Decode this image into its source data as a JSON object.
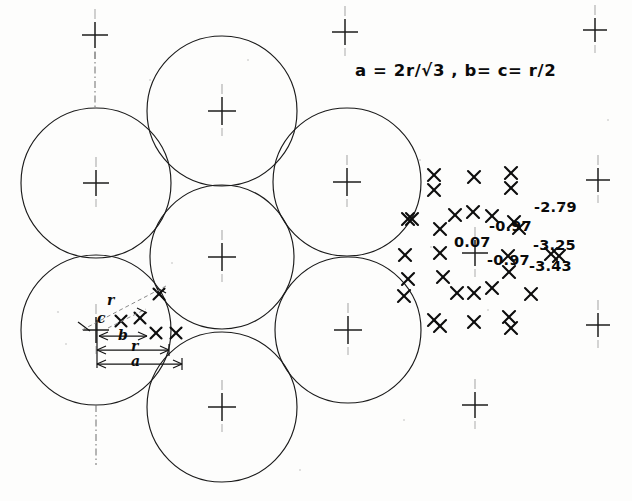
{
  "figure": {
    "kind": "engineering-drawing",
    "background_color": "#fdfdfc",
    "ink_color": "#0d0d0d"
  },
  "formula": {
    "text": "a =  2r/√3  ,   b=  c=  r/2",
    "parts": {
      "a_expression": "a = 2r/√3",
      "separator": ",",
      "bc_expression": "b= c= r/2"
    },
    "x": 355,
    "y": 76
  },
  "dimension_labels": [
    {
      "name": "r-radius-upper",
      "text": "r",
      "x": 107,
      "y": 305
    },
    {
      "name": "c-dimension",
      "text": "c",
      "x": 97,
      "y": 323
    },
    {
      "name": "b-dimension",
      "text": "b",
      "x": 118,
      "y": 340
    },
    {
      "name": "r-dimension-lower",
      "text": "r",
      "x": 131,
      "y": 351
    },
    {
      "name": "a-dimension",
      "text": "a",
      "x": 131,
      "y": 366
    }
  ],
  "measurements": [
    {
      "name": "value-center",
      "text": "0.07",
      "x": 454,
      "y": 247
    },
    {
      "name": "value-upper-mid",
      "text": "-0.97",
      "x": 489,
      "y": 231
    },
    {
      "name": "value-lower-mid",
      "text": "-0.97",
      "x": 487,
      "y": 265
    },
    {
      "name": "value-top-right",
      "text": "-2.79",
      "x": 534,
      "y": 212
    },
    {
      "name": "value-mid-right",
      "text": "-3.25",
      "x": 533,
      "y": 250
    },
    {
      "name": "value-bottom-right",
      "text": "-3.43",
      "x": 529,
      "y": 271
    }
  ],
  "circles": [
    {
      "name": "circle-top-center",
      "cx": 222,
      "cy": 111,
      "r": 75
    },
    {
      "name": "circle-upper-left",
      "cx": 96,
      "cy": 183,
      "r": 75
    },
    {
      "name": "circle-upper-right",
      "cx": 347,
      "cy": 182,
      "r": 74
    },
    {
      "name": "circle-center",
      "cx": 222,
      "cy": 257,
      "r": 72
    },
    {
      "name": "circle-lower-left",
      "cx": 96,
      "cy": 330,
      "r": 75
    },
    {
      "name": "circle-lower-right",
      "cx": 348,
      "cy": 330,
      "r": 73
    },
    {
      "name": "circle-bottom-center",
      "cx": 222,
      "cy": 407,
      "r": 75
    }
  ],
  "crosshairs": [
    {
      "name": "crosshair-top-left-stray",
      "cx": 95,
      "cy": 35,
      "size": 13,
      "faint": false
    },
    {
      "name": "crosshair-top-right-stray",
      "cx": 345,
      "cy": 32,
      "size": 13,
      "faint": false
    },
    {
      "name": "crosshair-far-top-right",
      "cx": 595,
      "cy": 30,
      "size": 12,
      "faint": false
    },
    {
      "name": "crosshair-top-center",
      "cx": 222,
      "cy": 111,
      "size": 14,
      "faint": false
    },
    {
      "name": "crosshair-upper-left",
      "cx": 96,
      "cy": 183,
      "size": 13,
      "faint": false
    },
    {
      "name": "crosshair-upper-right",
      "cx": 347,
      "cy": 182,
      "size": 14,
      "faint": false
    },
    {
      "name": "crosshair-far-right-upper",
      "cx": 598,
      "cy": 180,
      "size": 12,
      "faint": false
    },
    {
      "name": "crosshair-center",
      "cx": 222,
      "cy": 257,
      "size": 14,
      "faint": false
    },
    {
      "name": "crosshair-measure-origin",
      "cx": 475,
      "cy": 253,
      "size": 13,
      "faint": false
    },
    {
      "name": "crosshair-lower-left",
      "cx": 96,
      "cy": 330,
      "size": 13,
      "faint": false
    },
    {
      "name": "crosshair-lower-right",
      "cx": 348,
      "cy": 330,
      "size": 14,
      "faint": false
    },
    {
      "name": "crosshair-far-right-lower",
      "cx": 598,
      "cy": 325,
      "size": 12,
      "faint": false
    },
    {
      "name": "crosshair-bottom-center",
      "cx": 222,
      "cy": 407,
      "size": 14,
      "faint": false
    },
    {
      "name": "crosshair-bottom-right-stray",
      "cx": 475,
      "cy": 405,
      "size": 13,
      "faint": false
    }
  ],
  "centerlines": [
    {
      "name": "centerline-top-vertical",
      "x1": 95,
      "y1": 52,
      "x2": 95,
      "y2": 108
    },
    {
      "name": "centerline-bottom-vertical",
      "x1": 96,
      "y1": 405,
      "x2": 96,
      "y2": 465
    }
  ],
  "xmarks": [
    {
      "x": 434,
      "y": 175
    },
    {
      "x": 434,
      "y": 190
    },
    {
      "x": 474,
      "y": 177
    },
    {
      "x": 511,
      "y": 173
    },
    {
      "x": 511,
      "y": 188
    },
    {
      "x": 412,
      "y": 219
    },
    {
      "x": 455,
      "y": 215
    },
    {
      "x": 473,
      "y": 212
    },
    {
      "x": 492,
      "y": 216
    },
    {
      "x": 440,
      "y": 229
    },
    {
      "x": 514,
      "y": 222
    },
    {
      "x": 519,
      "y": 228
    },
    {
      "x": 405,
      "y": 255
    },
    {
      "x": 440,
      "y": 253
    },
    {
      "x": 508,
      "y": 256
    },
    {
      "x": 551,
      "y": 254
    },
    {
      "x": 559,
      "y": 256
    },
    {
      "x": 408,
      "y": 279
    },
    {
      "x": 443,
      "y": 277
    },
    {
      "x": 509,
      "y": 272
    },
    {
      "x": 457,
      "y": 293
    },
    {
      "x": 474,
      "y": 293
    },
    {
      "x": 492,
      "y": 288
    },
    {
      "x": 531,
      "y": 294
    },
    {
      "x": 434,
      "y": 320
    },
    {
      "x": 440,
      "y": 326
    },
    {
      "x": 474,
      "y": 322
    },
    {
      "x": 509,
      "y": 317
    },
    {
      "x": 511,
      "y": 328
    },
    {
      "x": 408,
      "y": 219
    },
    {
      "x": 404,
      "y": 296
    }
  ],
  "xmarks_on_circles": [
    {
      "x": 159,
      "y": 294
    },
    {
      "x": 156,
      "y": 333
    },
    {
      "x": 176,
      "y": 333
    },
    {
      "x": 140,
      "y": 318
    },
    {
      "x": 121,
      "y": 321
    }
  ]
}
